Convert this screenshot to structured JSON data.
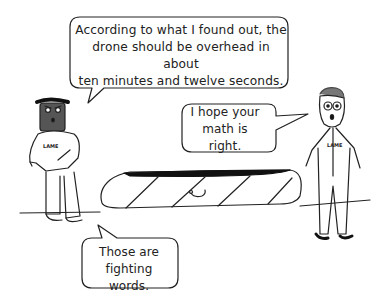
{
  "comic": {
    "bubbles": [
      {
        "speaker": "left-character",
        "lines": [
          "According to what I found out, the",
          "drone should be overhead in about",
          "ten minutes and twelve seconds."
        ]
      },
      {
        "speaker": "right-character",
        "lines": [
          "I hope your",
          "math is right."
        ]
      },
      {
        "speaker": "left-character",
        "lines": [
          "Those are",
          "fighting words."
        ]
      }
    ],
    "characters": [
      {
        "name": "dark-skinned character",
        "shirt_text": "LAME"
      },
      {
        "name": "character with glasses",
        "shirt_text": "LAME"
      }
    ],
    "object": "striped drone casing on ground",
    "colors": {
      "ink": "#222222",
      "skin_dark": "#555555",
      "hair_gray": "#777777",
      "background": "#ffffff"
    }
  }
}
